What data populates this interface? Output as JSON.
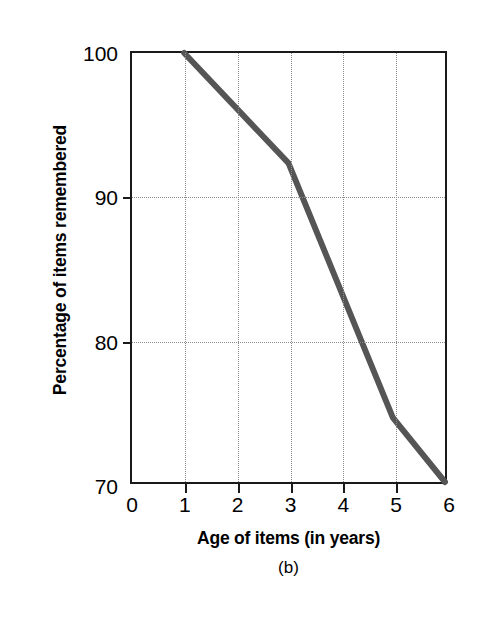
{
  "figure": {
    "panel_caption": "(b)",
    "line_color": "#555555",
    "axis_color": "#1a1a1a",
    "grid_color": "#8a8a8a",
    "background": "#ffffff"
  },
  "chart_data": {
    "type": "line",
    "title": "",
    "xlabel": "Age of items (in years)",
    "ylabel": "Percentage of items remembered",
    "xlim": [
      0,
      6
    ],
    "ylim": [
      70,
      100
    ],
    "xticks": [
      0,
      1,
      2,
      3,
      4,
      5,
      6
    ],
    "xticklabels": [
      "0",
      "1",
      "2",
      "3",
      "4",
      "5",
      "6"
    ],
    "yticks": [
      70,
      80,
      90,
      100
    ],
    "yticklabels": [
      "70",
      "80",
      "90",
      "100"
    ],
    "grid": true,
    "grid_style": "dotted",
    "grid_x_values": [
      1,
      2,
      3,
      4,
      5
    ],
    "grid_y_values": [
      80,
      90
    ],
    "legend": null,
    "series": [
      {
        "name": "Percentage of items remembered",
        "x": [
          1,
          3,
          5,
          6
        ],
        "y": [
          100,
          92.3,
          74.5,
          70
        ]
      }
    ]
  }
}
